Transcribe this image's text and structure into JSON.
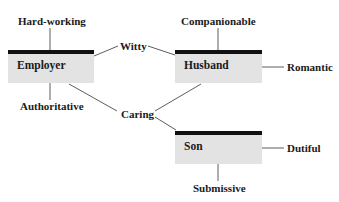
{
  "diagram": {
    "roles": [
      {
        "id": "employer",
        "label": "Employer"
      },
      {
        "id": "husband",
        "label": "Husband"
      },
      {
        "id": "son",
        "label": "Son"
      }
    ],
    "traits": {
      "hard_working": "Hard-working",
      "authoritative": "Authoritative",
      "witty": "Witty",
      "caring": "Caring",
      "companionable": "Companionable",
      "romantic": "Romantic",
      "dutiful": "Dutiful",
      "submissive": "Submissive"
    },
    "connections": [
      {
        "from": "Employer",
        "to": "Hard-working"
      },
      {
        "from": "Employer",
        "to": "Authoritative"
      },
      {
        "from": "Employer",
        "to": "Witty"
      },
      {
        "from": "Employer",
        "to": "Caring"
      },
      {
        "from": "Husband",
        "to": "Companionable"
      },
      {
        "from": "Husband",
        "to": "Romantic"
      },
      {
        "from": "Husband",
        "to": "Witty"
      },
      {
        "from": "Husband",
        "to": "Caring"
      },
      {
        "from": "Son",
        "to": "Caring"
      },
      {
        "from": "Son",
        "to": "Dutiful"
      },
      {
        "from": "Son",
        "to": "Submissive"
      }
    ],
    "colors": {
      "box_fill": "#e3e3e3",
      "box_bar": "#111111",
      "line": "#333333"
    }
  }
}
